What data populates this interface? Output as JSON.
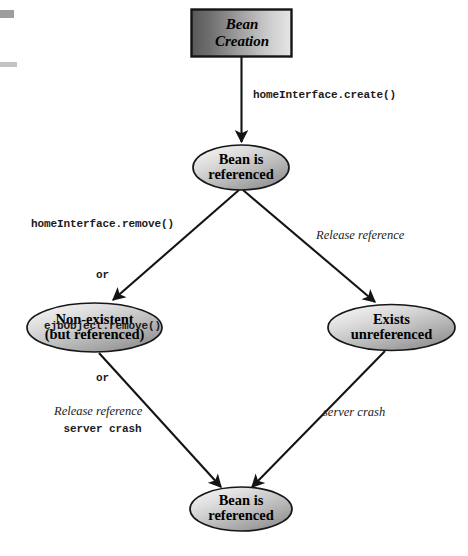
{
  "diagram": {
    "nodes": {
      "bean_creation": {
        "line1": "Bean",
        "line2": "Creation"
      },
      "bean_referenced_top": {
        "line1": "Bean is",
        "line2": "referenced"
      },
      "non_existent": {
        "line1": "Non-existent",
        "line2": "(but referenced)"
      },
      "exists_unreferenced": {
        "line1": "Exists",
        "line2": "unreferenced"
      },
      "bean_referenced_bottom": {
        "line1": "Bean is",
        "line2": "referenced"
      }
    },
    "edge_labels": {
      "create": "homeInterface.create()",
      "remove_block": {
        "line1": "homeInterface.remove()",
        "line2": "or",
        "line3": "ejbObject.remove()",
        "line4": "or",
        "line5": "server crash"
      },
      "release_reference_right": "Release reference",
      "release_reference_left": "Release reference",
      "server_crash": "server crash"
    },
    "colors": {
      "stroke": "#111111",
      "box_fill_dark": "#5d5d5d",
      "box_fill_light": "#e4e4e4",
      "ellipse_fill_light": "#f2f2f2",
      "ellipse_fill_mid": "#b9b9b9",
      "ellipse_fill_dark": "#8f8f8f",
      "background": "#ffffff",
      "artifact": "#a9a9a9"
    }
  }
}
